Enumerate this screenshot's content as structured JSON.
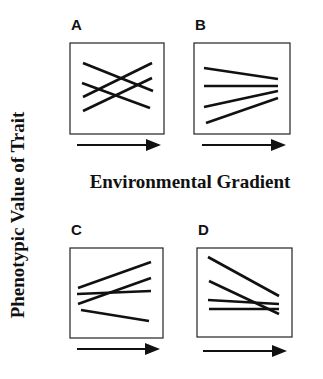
{
  "figure": {
    "y_axis_label": "Phenotypic Value of Trait",
    "x_axis_label": "Environmental Gradient",
    "colors": {
      "line": "#111111",
      "box": "#222222",
      "background": "#ffffff"
    }
  },
  "chart_data": [
    {
      "type": "line",
      "panel": "A",
      "title": "A",
      "xlabel": "Environmental Gradient (arrow)",
      "ylabel": "Phenotypic Value of Trait",
      "description": "Four reaction norms with crossing slopes (two increasing, two decreasing)",
      "box": [
        70,
        43,
        164,
        134
      ],
      "series": [
        {
          "name": "line1",
          "points": [
            [
              83,
              63
            ],
            [
              153,
              91
            ]
          ]
        },
        {
          "name": "line2",
          "points": [
            [
              83,
              97
            ],
            [
              152,
              63
            ]
          ]
        },
        {
          "name": "line3",
          "points": [
            [
              82,
              83
            ],
            [
              150,
              108
            ]
          ]
        },
        {
          "name": "line4",
          "points": [
            [
              83,
              111
            ],
            [
              152,
              78
            ]
          ]
        }
      ],
      "arrow": {
        "y": 145,
        "x1": 77,
        "x2": 161
      }
    },
    {
      "type": "line",
      "panel": "B",
      "title": "B",
      "xlabel": "Environmental Gradient (arrow)",
      "ylabel": "Phenotypic Value of Trait",
      "description": "Four reaction norms converging to a similar value at high end of gradient",
      "box": [
        194,
        43,
        290,
        134
      ],
      "series": [
        {
          "name": "line1",
          "points": [
            [
              204,
              68
            ],
            [
              278,
              79
            ]
          ]
        },
        {
          "name": "line2",
          "points": [
            [
              204,
              86
            ],
            [
              278,
              86
            ]
          ]
        },
        {
          "name": "line3",
          "points": [
            [
              204,
              107
            ],
            [
              278,
              91
            ]
          ]
        },
        {
          "name": "line4",
          "points": [
            [
              206,
              123
            ],
            [
              278,
              98
            ]
          ]
        }
      ],
      "arrow": {
        "y": 145,
        "x1": 202,
        "x2": 286
      }
    },
    {
      "type": "line",
      "panel": "C",
      "title": "C",
      "xlabel": "Environmental Gradient (arrow)",
      "ylabel": "Phenotypic Value of Trait",
      "description": "Four reaction norms diverging from similar values at low end of gradient",
      "box": [
        70,
        248,
        163,
        338
      ],
      "series": [
        {
          "name": "line1",
          "points": [
            [
              78,
              288
            ],
            [
              151,
              262
            ]
          ]
        },
        {
          "name": "line2",
          "points": [
            [
              77,
              294
            ],
            [
              151,
              291
            ]
          ]
        },
        {
          "name": "line3",
          "points": [
            [
              78,
              304
            ],
            [
              151,
              278
            ]
          ]
        },
        {
          "name": "line4",
          "points": [
            [
              81,
              310
            ],
            [
              149,
              321
            ]
          ]
        }
      ],
      "arrow": {
        "y": 349,
        "x1": 77,
        "x2": 160
      }
    },
    {
      "type": "line",
      "panel": "D",
      "title": "D",
      "xlabel": "Environmental Gradient (arrow)",
      "ylabel": "Phenotypic Value of Trait",
      "description": "Four reaction norms, mostly decreasing, converging and crossing at high end",
      "box": [
        197,
        248,
        292,
        337
      ],
      "series": [
        {
          "name": "line1",
          "points": [
            [
              208,
              257
            ],
            [
              279,
              296
            ]
          ]
        },
        {
          "name": "line2",
          "points": [
            [
              209,
              281
            ],
            [
              279,
              314
            ]
          ]
        },
        {
          "name": "line3",
          "points": [
            [
              208,
              300
            ],
            [
              279,
              304
            ]
          ]
        },
        {
          "name": "line4",
          "points": [
            [
              209,
              309
            ],
            [
              279,
              309
            ]
          ]
        }
      ],
      "arrow": {
        "y": 351,
        "x1": 203,
        "x2": 287
      }
    }
  ]
}
